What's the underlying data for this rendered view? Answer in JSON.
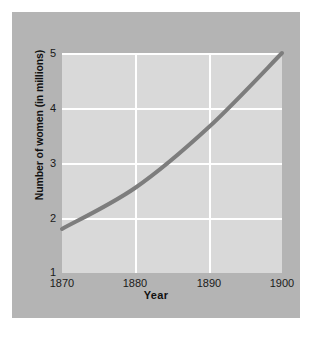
{
  "chart_data": {
    "type": "line",
    "title": "",
    "subtitle": "",
    "xlabel": "Year",
    "ylabel": "Number of women (in millions)",
    "x": [
      1870,
      1880,
      1890,
      1900
    ],
    "values": [
      1.8,
      2.55,
      3.65,
      5.0
    ],
    "series": [
      {
        "name": "Number of women",
        "values": [
          1.8,
          2.55,
          3.65,
          5.0
        ]
      }
    ],
    "xlim": [
      1870,
      1900
    ],
    "ylim": [
      1,
      5
    ],
    "xticks": [
      "1870",
      "1880",
      "1890",
      "1900"
    ],
    "yticks": [
      "1",
      "2",
      "3",
      "4",
      "5"
    ],
    "grid": "horizontal-and-vertical",
    "legend": "none",
    "line_color": "#7d7d7d",
    "plot_background": "#d9d9d9",
    "figure_background": "#b4b4b4",
    "gridline_color": "#ffffff"
  },
  "axes": {
    "y": {
      "label": "Number of women (in millions)",
      "ticks": [
        {
          "label": "5",
          "value": 5
        },
        {
          "label": "4",
          "value": 4
        },
        {
          "label": "3",
          "value": 3
        },
        {
          "label": "2",
          "value": 2
        },
        {
          "label": "1",
          "value": 1
        }
      ]
    },
    "x": {
      "label": "Year",
      "ticks": [
        {
          "label": "1870",
          "value": 1870
        },
        {
          "label": "1880",
          "value": 1880
        },
        {
          "label": "1890",
          "value": 1890
        },
        {
          "label": "1900",
          "value": 1900
        }
      ]
    }
  }
}
